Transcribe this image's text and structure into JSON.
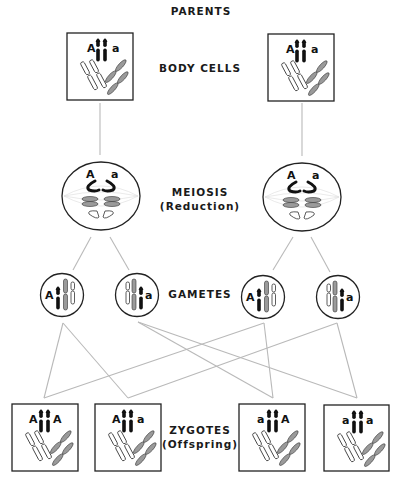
{
  "labels": {
    "parents": "PARENTS",
    "body_cells": "BODY CELLS",
    "meiosis": "MEIOSIS",
    "meiosis_sub": "(Reduction)",
    "gametes": "GAMETES",
    "zygotes": "ZYGOTES",
    "zygotes_sub": "(Offspring)"
  },
  "parents": [
    {
      "id": "parent-left",
      "alleles": [
        "A",
        "a"
      ]
    },
    {
      "id": "parent-right",
      "alleles": [
        "A",
        "a"
      ]
    }
  ],
  "meiosis_cells": [
    {
      "id": "meiosis-left",
      "alleles": [
        "A",
        "a"
      ]
    },
    {
      "id": "meiosis-right",
      "alleles": [
        "A",
        "a"
      ]
    }
  ],
  "gametes": [
    {
      "id": "gamete-1",
      "allele": "A"
    },
    {
      "id": "gamete-2",
      "allele": "a"
    },
    {
      "id": "gamete-3",
      "allele": "A"
    },
    {
      "id": "gamete-4",
      "allele": "a"
    }
  ],
  "zygotes": [
    {
      "id": "zygote-1",
      "alleles": [
        "A",
        "A"
      ]
    },
    {
      "id": "zygote-2",
      "alleles": [
        "A",
        "a"
      ]
    },
    {
      "id": "zygote-3",
      "alleles": [
        "a",
        "A"
      ]
    },
    {
      "id": "zygote-4",
      "alleles": [
        "a",
        "a"
      ]
    }
  ],
  "colors": {
    "line": "#b9b9b9",
    "outline": "#222222",
    "dark_chromosome": "#111111",
    "gray_chromosome": "#9a9a9a"
  }
}
